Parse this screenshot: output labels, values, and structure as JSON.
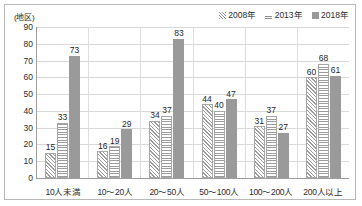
{
  "chart_data": {
    "type": "bar",
    "title": "",
    "subtitle": "",
    "unit_label": "(地区)",
    "xlabel": "",
    "ylabel": "",
    "ylim": [
      0,
      90
    ],
    "ytick_step": 10,
    "yticks": [
      "90",
      "80",
      "70",
      "60",
      "50",
      "40",
      "30",
      "20",
      "10",
      "0"
    ],
    "grid": true,
    "legend_position": "top-right",
    "categories": [
      "10人未満",
      "10〜20人",
      "20〜50人",
      "50〜100人",
      "100〜200人",
      "200人以上"
    ],
    "series": [
      {
        "name": "2008年",
        "pattern": "diagonal-hatch",
        "color": "#9b9b9b",
        "values": [
          15,
          16,
          34,
          44,
          31,
          60
        ]
      },
      {
        "name": "2013年",
        "pattern": "horizontal-stripe",
        "color": "#9b9b9b",
        "values": [
          33,
          19,
          37,
          40,
          37,
          68
        ]
      },
      {
        "name": "2018年",
        "pattern": "solid",
        "color": "#9a9a9a",
        "values": [
          73,
          29,
          83,
          47,
          27,
          61
        ]
      }
    ]
  },
  "colors": {
    "frame": "#b9b9b9",
    "gridline": "#d8d8d8",
    "axis": "#9d9d9d",
    "solid_bar": "#9a9a9a",
    "pattern_ink": "#9b9b9b",
    "text": "#2b2b2b",
    "background": "#ffffff"
  }
}
